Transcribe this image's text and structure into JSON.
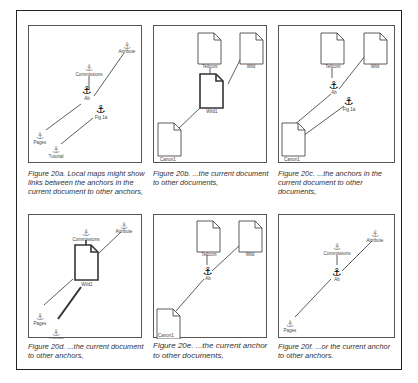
{
  "figure": {
    "panels": [
      {
        "id": "a",
        "caption": "Figure 20a.  Local maps might show links between the  anchors in the current  document to other anchors,",
        "anchors": [
          {
            "label": "Commissions",
            "x": 60,
            "y": 39,
            "bold": false
          },
          {
            "label": "Attribute",
            "x": 97,
            "y": 17,
            "bold": false
          },
          {
            "label": "Ab",
            "x": 57,
            "y": 62,
            "bold": true
          },
          {
            "label": "Fig 1a",
            "x": 70,
            "y": 81,
            "bold": true
          },
          {
            "label": "Pages",
            "x": 11,
            "y": 107,
            "bold": false
          },
          {
            "label": "Tutorial",
            "x": 27,
            "y": 121,
            "bold": false
          }
        ]
      },
      {
        "id": "b",
        "caption": "Figure 20b.  ...the current document to other documents,",
        "documents": [
          {
            "label": "Tellcont",
            "x": 46,
            "y": 8,
            "bold": false
          },
          {
            "label": "Wild",
            "x": 87,
            "y": 8,
            "bold": false
          },
          {
            "label": "Wild1",
            "x": 47,
            "y": 48,
            "bold": true
          },
          {
            "label": "Canon1",
            "x": 5,
            "y": 97,
            "bold": false
          }
        ]
      },
      {
        "id": "c",
        "caption": "Figure 20c.  ...the anchors in the current document to other documents,",
        "documents": [
          {
            "label": "Tellcont",
            "x": 42,
            "y": 8,
            "bold": false
          },
          {
            "label": "Wild",
            "x": 85,
            "y": 8,
            "bold": false
          },
          {
            "label": "Canon1",
            "x": 3,
            "y": 97,
            "bold": false
          }
        ],
        "anchors": [
          {
            "label": "Ab",
            "x": 57,
            "y": 58,
            "bold": true
          },
          {
            "label": "Fig 1a",
            "x": 70,
            "y": 74,
            "bold": true
          }
        ]
      },
      {
        "id": "d",
        "caption": "Figure 20d.  ...the current document to other anchors,",
        "documents": [
          {
            "label": "Wild1",
            "x": 46,
            "y": 30,
            "bold": true
          }
        ],
        "anchors": [
          {
            "label": "Commissions",
            "x": 57,
            "y": 16,
            "bold": false
          },
          {
            "label": "Attribute",
            "x": 94,
            "y": 8,
            "bold": false
          },
          {
            "label": "Pages",
            "x": 11,
            "y": 100,
            "bold": false
          },
          {
            "label": "Tutorial",
            "x": 26,
            "y": 116,
            "bold": false
          }
        ]
      },
      {
        "id": "e",
        "caption": "Figure 20e.  ...the current anchor to other documents,",
        "documents": [
          {
            "label": "Tellcont",
            "x": 44,
            "y": 6,
            "bold": false
          },
          {
            "label": "Wild",
            "x": 86,
            "y": 6,
            "bold": false
          },
          {
            "label": "Canon1",
            "x": 3,
            "y": 94,
            "bold": false
          }
        ],
        "anchors": [
          {
            "label": "Ab",
            "x": 53,
            "y": 56,
            "bold": true
          }
        ]
      },
      {
        "id": "f",
        "caption": "Figure 20f.  ...or the current anchor to other anchors.",
        "anchors": [
          {
            "label": "Commissions",
            "x": 58,
            "y": 29,
            "bold": false
          },
          {
            "label": "Attribute",
            "x": 95,
            "y": 16,
            "bold": false
          },
          {
            "label": "Ab",
            "x": 57,
            "y": 55,
            "bold": true
          },
          {
            "label": "Pages",
            "x": 10,
            "y": 107,
            "bold": false
          }
        ]
      }
    ]
  }
}
